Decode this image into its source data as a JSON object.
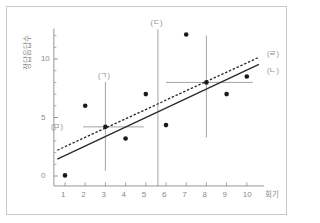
{
  "figure": {
    "background": "#ffffff",
    "frame_color": "#c9c9c9",
    "axis_color": "#8a8a8a",
    "point_color": "#1a1a1a",
    "line_color": "#2a2a2a"
  },
  "chart_data": {
    "type": "scatter",
    "title": "",
    "xlabel": "회기",
    "ylabel": "정답음답수",
    "xlim": [
      0.3,
      10.9
    ],
    "ylim": [
      -1.2,
      13.2
    ],
    "xticks": [
      1,
      2,
      3,
      4,
      5,
      6,
      7,
      8,
      9,
      10
    ],
    "xticklabels": [
      "1",
      "2",
      "3",
      "4",
      "5",
      "6",
      "7",
      "8",
      "9",
      "10"
    ],
    "yticks": [
      0,
      5,
      10
    ],
    "yticklabels": [
      "0",
      "5",
      "10"
    ],
    "yminorticks": [
      1,
      2,
      3,
      4,
      6,
      7,
      8,
      9,
      11,
      12
    ],
    "grid": false,
    "legend_position": "right",
    "points": [
      {
        "x": 1,
        "y": 0.05
      },
      {
        "x": 2,
        "y": 6.0
      },
      {
        "x": 3,
        "y": 4.2
      },
      {
        "x": 4,
        "y": 3.2
      },
      {
        "x": 5,
        "y": 7.0
      },
      {
        "x": 6,
        "y": 4.35
      },
      {
        "x": 7,
        "y": 12.1
      },
      {
        "x": 8,
        "y": 8.0
      },
      {
        "x": 9,
        "y": 7.0
      },
      {
        "x": 10,
        "y": 8.5
      }
    ],
    "series": [
      {
        "name": "(ㄴ)",
        "style": "solid",
        "label": "(ㄴ)",
        "x": [
          0.62,
          10.6
        ],
        "y": [
          1.45,
          9.55
        ]
      },
      {
        "name": "(ㄹ)",
        "style": "dashed",
        "label": "(ㄹ)",
        "x": [
          0.62,
          10.6
        ],
        "y": [
          2.2,
          10.15
        ]
      }
    ],
    "crosshairs": [
      {
        "name": "(ㄱ)",
        "x": 3,
        "y": 4.2,
        "vx_from": 0.45,
        "vx_to": 8.05,
        "hx_from": 1.9,
        "hx_to": 4.9
      },
      {
        "name": "",
        "x": 8,
        "y": 8.0,
        "vx_from": 3.3,
        "vx_to": 12.0,
        "hx_from": 6.0,
        "hx_to": 10.3
      }
    ],
    "vertical_marker": {
      "name": "(ㄷ)",
      "x": 5.6,
      "y_from": -0.9,
      "y_to": 12.55
    },
    "annotations": [
      {
        "text": "(ㄱ)",
        "x": 3.0,
        "y": 8.55,
        "anchor": "center"
      },
      {
        "text": "(ㄷ)",
        "x": 5.6,
        "y": 13.1,
        "anchor": "center"
      },
      {
        "text": "(ㅁ)",
        "x": 1.05,
        "y": 4.2,
        "anchor": "end"
      },
      {
        "text": "(ㄹ)",
        "x": 11.0,
        "y": 10.4,
        "anchor": "start"
      },
      {
        "text": "(ㄴ)",
        "x": 11.0,
        "y": 9.0,
        "anchor": "start"
      }
    ]
  }
}
